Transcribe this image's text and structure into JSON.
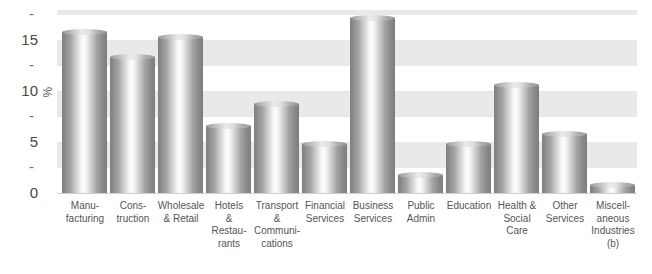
{
  "chart_data": {
    "type": "bar",
    "title": "",
    "subtitle": "",
    "xlabel": "",
    "ylabel": "%",
    "ylim": [
      0,
      18
    ],
    "grid": "horizontal-bands",
    "legend": "none",
    "categories": [
      "Manu-\nfacturing",
      "Cons-\ntruction",
      "Wholesale\n& Retail",
      "Hotels\n&\nRestau-\nrants",
      "Transport\n&\nCommuni-\ncations",
      "Financial\nServices",
      "Business\nServices",
      "Public\nAdmin",
      "Education",
      "Health &\nSocial\nCare",
      "Other\nServices",
      "Miscell-\naneous\nIndustries\n(b)"
    ],
    "values": [
      15.8,
      13.3,
      15.3,
      6.6,
      8.7,
      4.8,
      17.2,
      1.8,
      4.8,
      10.6,
      5.8,
      0.8
    ],
    "y_ticks_labeled": [
      "0",
      "5",
      "10",
      "15"
    ],
    "y_tick_values": [
      0,
      5,
      10,
      15
    ],
    "y_minor_ticks": [
      "-",
      "-",
      "-",
      "-"
    ],
    "y_minor_tick_values": [
      2.5,
      7.5,
      12.5,
      17.5
    ],
    "bar_color": "#9a9a9a",
    "band_color": "#e9e9e9",
    "background_color": "#ffffff",
    "text_color": "#555555"
  },
  "axis": {
    "y_title": "%"
  }
}
